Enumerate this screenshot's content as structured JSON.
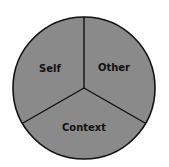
{
  "diagram": {
    "type": "three-part circle",
    "fill_color": "#8a8a8a",
    "stroke_color": "#111111",
    "segments": [
      {
        "label": "Self",
        "position": "upper-left"
      },
      {
        "label": "Other",
        "position": "upper-right"
      },
      {
        "label": "Context",
        "position": "bottom"
      }
    ]
  }
}
